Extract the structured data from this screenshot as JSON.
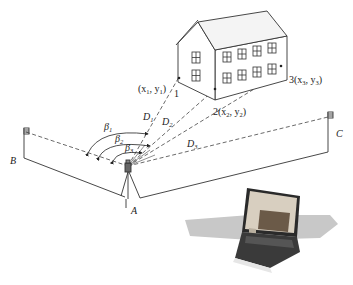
{
  "diagram": {
    "type": "surveying-setup",
    "points": {
      "A": {
        "label": "A",
        "role": "instrument station"
      },
      "B": {
        "label": "B",
        "role": "backsight flag"
      },
      "C": {
        "label": "C",
        "role": "backsight flag"
      }
    },
    "targets": [
      {
        "id": "1",
        "label": "1",
        "coords_label": "(x",
        "sub1": "1",
        "mid": ", y",
        "sub2": "1",
        "end": ")"
      },
      {
        "id": "2",
        "label": "2",
        "coords_label": "2(x",
        "sub1": "2",
        "mid": ", y",
        "sub2": "2",
        "end": ")"
      },
      {
        "id": "3",
        "label": "3",
        "coords_label": "3(x",
        "sub1": "3",
        "mid": ", y",
        "sub2": "3",
        "end": ")"
      }
    ],
    "distances": [
      {
        "label": "D",
        "sub": "1"
      },
      {
        "label": "D",
        "sub": "2"
      },
      {
        "label": "D",
        "sub": "3"
      }
    ],
    "angles": [
      {
        "label": "β",
        "sub": "1"
      },
      {
        "label": "β",
        "sub": "2"
      },
      {
        "label": "β",
        "sub": "3"
      }
    ],
    "colors": {
      "line": "#333333",
      "dash": "#444444",
      "shadow": "#bfbfbf",
      "laptop_body": "#2a2a2a",
      "laptop_screen": "#7a6a5a"
    }
  }
}
